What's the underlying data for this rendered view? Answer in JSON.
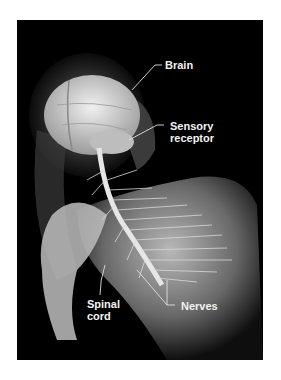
{
  "figure": {
    "background_color": "#000000",
    "page_color": "#ffffff",
    "labels": {
      "brain": "Brain",
      "sensory_line1": "Sensory",
      "sensory_line2": "receptor",
      "spinal_line1": "Spinal",
      "spinal_line2": "cord",
      "nerves": "Nerves"
    }
  }
}
